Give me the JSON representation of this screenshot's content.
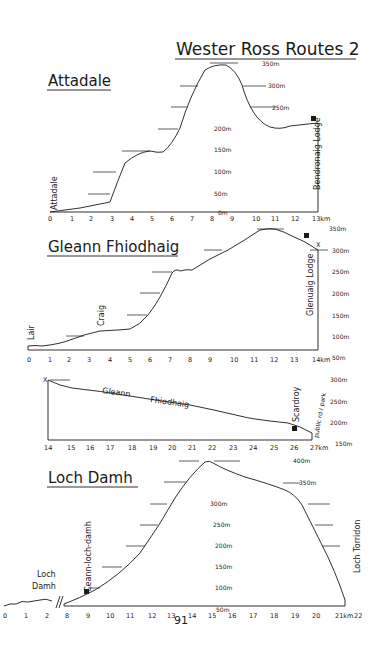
{
  "title": "Wester Ross Routes 2",
  "page_number": "91",
  "profiles": [
    {
      "name": "Attadale",
      "x_ticks": [
        "0",
        "1",
        "2",
        "3",
        "4",
        "5",
        "6",
        "7",
        "8",
        "9",
        "10",
        "11",
        "12",
        "13km"
      ],
      "elev_labels": [
        "350m",
        "300m",
        "250m",
        "200m",
        "150m",
        "100m",
        "50m",
        "0m"
      ],
      "places": {
        "start": "Attadale",
        "end": "Bendronaig Lodge"
      }
    },
    {
      "name": "Gleann Fhiodhaig",
      "x_ticks": [
        "0",
        "1",
        "2",
        "3",
        "4",
        "5",
        "6",
        "7",
        "8",
        "9",
        "10",
        "11",
        "12",
        "13",
        "14km"
      ],
      "elev_labels": [
        "350m",
        "300m",
        "250m",
        "200m",
        "150m",
        "100m",
        "50m"
      ],
      "places": {
        "start": "Lair",
        "mid": "Craig",
        "end": "Glenuaig Lodge",
        "marker": "X"
      }
    },
    {
      "name": "Gleann Fhiodhaig (cont.)",
      "label_a": "Gleann",
      "label_b": "Fhiodhaig",
      "x_ticks": [
        "14",
        "15",
        "16",
        "17",
        "18",
        "19",
        "20",
        "21",
        "22",
        "23",
        "24",
        "25",
        "26",
        "27km"
      ],
      "elev_labels": [
        "300m",
        "250m",
        "200m",
        "150m"
      ],
      "places": {
        "start_marker": "X",
        "end": "Scardroy",
        "end2": "public rd / park"
      }
    },
    {
      "name": "Loch Damh",
      "x_ticks": [
        "0",
        "1",
        "2",
        "8",
        "9",
        "10",
        "11",
        "12",
        "13",
        "14",
        "15",
        "16",
        "17",
        "18",
        "19",
        "20",
        "21km",
        "22"
      ],
      "elev_labels": [
        "400m",
        "350m",
        "300m",
        "250m",
        "200m",
        "150m",
        "100m",
        "50m"
      ],
      "places": {
        "start": "Loch Damh",
        "mid": "Ceann-loch-damh",
        "end": "Loch Torridon"
      }
    }
  ]
}
